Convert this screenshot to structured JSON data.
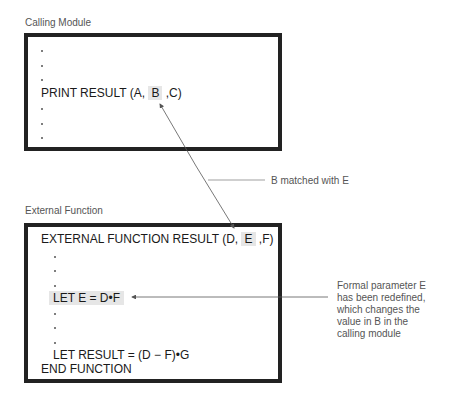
{
  "calling_module": {
    "caption": "Calling Module",
    "lines": {
      "print_prefix": "PRINT RESULT (A,",
      "print_highlight": "B",
      "print_suffix": ",C)"
    }
  },
  "external_function": {
    "caption": "External Function",
    "lines": {
      "header_prefix": "EXTERNAL FUNCTION RESULT (D,",
      "header_highlight": "E",
      "header_suffix": ",F)",
      "let_e": "LET E = D•F",
      "let_result": "LET RESULT = (D − F)•G",
      "end": "END FUNCTION"
    }
  },
  "annotations": {
    "match_note": "B matched with E",
    "redefine_note": [
      "Formal parameter E",
      "has been redefined,",
      "which changes the",
      "value in B in the",
      "calling module"
    ]
  },
  "colors": {
    "box_border": "#222222",
    "highlight": "#e6e6e6",
    "caption_text": "#555555",
    "arrow": "#555555"
  }
}
